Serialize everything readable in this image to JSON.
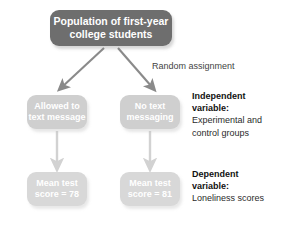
{
  "diagram": {
    "title_box": {
      "line1": "Population of first-year",
      "line2": "college students"
    },
    "random_assignment_label": "Random assignment",
    "conditions": [
      {
        "line1": "Allowed to",
        "line2": "text message"
      },
      {
        "line1": "No text",
        "line2": "messaging"
      }
    ],
    "outcomes": [
      {
        "line1": "Mean test",
        "line2": "score = 78"
      },
      {
        "line1": "Mean test",
        "line2": "score = 81"
      }
    ],
    "side_notes": [
      {
        "title_line1": "Independent",
        "title_line2": "variable:",
        "body_line1": "Experimental and",
        "body_line2": "control groups"
      },
      {
        "title_line1": "Dependent",
        "title_line2": "variable:",
        "body_line1": "Loneliness scores",
        "body_line2": ""
      }
    ],
    "colors": {
      "population_box": "#6e6e6e",
      "condition_box": "#cfcfcf",
      "outcome_box": "#d8d8d8",
      "branch_arrow": "#8a8a8a",
      "vertical_arrow": "#d2d2d2",
      "text_dark": "#2b2b2b",
      "text_light": "#ffffff"
    }
  }
}
